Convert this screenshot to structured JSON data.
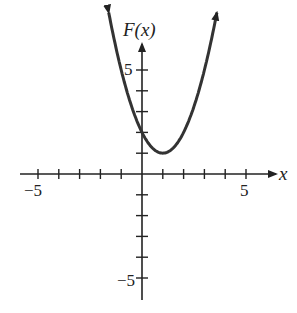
{
  "chart_data": {
    "type": "line",
    "title": "",
    "xlabel": "x",
    "ylabel": "F(x)",
    "function": "F(x) = (x - 1)^2 + 1",
    "xlim": [
      -6,
      6
    ],
    "ylim": [
      -6,
      6
    ],
    "x_tick_labels": [
      "-5",
      "5"
    ],
    "y_tick_labels": [
      "5",
      "-5"
    ],
    "grid": false,
    "series": [
      {
        "name": "F(x)",
        "x": [
          -1.5,
          -1,
          0,
          1,
          2,
          3,
          3.5
        ],
        "y": [
          7.25,
          5,
          2,
          1,
          2,
          5,
          7.25
        ]
      }
    ]
  },
  "labels": {
    "x_axis": "x",
    "y_axis": "F(x)",
    "x_neg": "−5",
    "x_pos": "5",
    "y_pos": "5",
    "y_neg": "−5"
  },
  "colors": {
    "curve": "#333333",
    "axis": "#222222"
  }
}
